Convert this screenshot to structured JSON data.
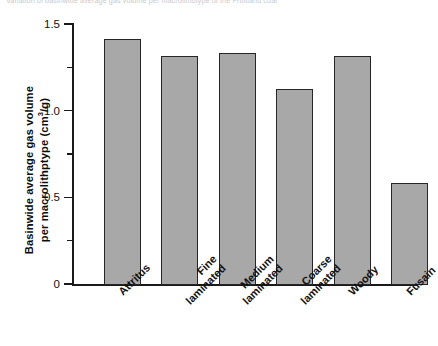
{
  "figure": {
    "caption_fragment": "Variation of basinwide average gas volume per macrolithotype of the Fruitland coal",
    "background_color": "#ffffff",
    "bar_fill_color": "#a8a8a8",
    "bar_edge_color": "#262626",
    "axis_color": "#1a1a1a"
  },
  "chart_data": {
    "type": "bar",
    "title": "",
    "xlabel": "",
    "ylabel": "Basinwide average gas volume per macrolithptype (cm3/g)",
    "ylabel_line1": "Basinwide average gas volume",
    "ylabel_line2_prefix": "per macrolithptype (cm",
    "ylabel_line2_sup": "3",
    "ylabel_line2_suffix": "/g)",
    "categories": [
      "Attritus",
      "Fine laminated",
      "Medium laminated",
      "Coarse laminated",
      "Woody",
      "Fusain"
    ],
    "category_lines": [
      [
        "Attritus",
        ""
      ],
      [
        "Fine",
        "laminated"
      ],
      [
        "Medium",
        "laminated"
      ],
      [
        "Coarse",
        "laminated"
      ],
      [
        "Woody",
        ""
      ],
      [
        "Fusain",
        ""
      ]
    ],
    "values": [
      1.42,
      1.32,
      1.34,
      1.13,
      1.32,
      0.59
    ],
    "ylim": [
      0,
      1.5
    ],
    "ytick_major": [
      "0",
      "0.5",
      "1.0",
      "1.5"
    ],
    "ytick_major_values": [
      0,
      0.5,
      1.0,
      1.5
    ],
    "ytick_minor_values": [
      0.25,
      0.75,
      1.25
    ],
    "grid": false,
    "legend": "none",
    "label_rotation_deg": -45
  }
}
